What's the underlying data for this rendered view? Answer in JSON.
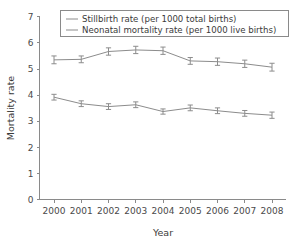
{
  "chart_data": {
    "type": "line",
    "title": "",
    "xlabel": "Year",
    "ylabel": "Mortality rate",
    "categories": [
      "2000",
      "2001",
      "2002",
      "2003",
      "2004",
      "2005",
      "2006",
      "2007",
      "2008"
    ],
    "x": [
      2000,
      2001,
      2002,
      2003,
      2004,
      2005,
      2006,
      2007,
      2008
    ],
    "xlim": [
      2000,
      2008
    ],
    "ylim": [
      0,
      7
    ],
    "yticks": [
      "0",
      "1",
      "2",
      "3",
      "4",
      "5",
      "6",
      "7"
    ],
    "ytick_values": [
      0,
      1,
      2,
      3,
      4,
      5,
      6,
      7
    ],
    "grid": false,
    "legend_position": "top",
    "series": [
      {
        "name": "Stillbirth rate (per 1000 total births)",
        "color": "#8c8c8c",
        "values": [
          5.35,
          5.37,
          5.67,
          5.73,
          5.7,
          5.31,
          5.28,
          5.2,
          5.07
        ],
        "errors": [
          0.15,
          0.13,
          0.14,
          0.14,
          0.14,
          0.13,
          0.14,
          0.14,
          0.15
        ]
      },
      {
        "name": "Neonatal mortality rate (per 1000 live births)",
        "color": "#8c8c8c",
        "values": [
          3.92,
          3.67,
          3.56,
          3.63,
          3.37,
          3.51,
          3.4,
          3.3,
          3.23
        ],
        "errors": [
          0.11,
          0.11,
          0.11,
          0.11,
          0.1,
          0.11,
          0.11,
          0.11,
          0.12
        ]
      }
    ]
  },
  "legend": {
    "entries": [
      {
        "label": "Stillbirth rate (per 1000 total births)"
      },
      {
        "label": "Neonatal mortality rate (per 1000 live births)"
      }
    ]
  },
  "axes": {
    "y_title": "Mortality rate",
    "x_title": "Year",
    "y_tick_labels": [
      "7",
      "6",
      "5",
      "4",
      "3",
      "2",
      "1",
      "0"
    ],
    "x_tick_labels": [
      "2000",
      "2001",
      "2002",
      "2003",
      "2004",
      "2005",
      "2006",
      "2007",
      "2008"
    ]
  }
}
